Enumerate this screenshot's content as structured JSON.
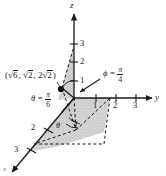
{
  "figure": {
    "axes": [
      {
        "name": "z",
        "id": "z-axis",
        "direction": "up"
      },
      {
        "name": "y",
        "id": "y-axis",
        "direction": "right"
      },
      {
        "name": "x",
        "id": "x-axis",
        "direction": "down-left"
      }
    ],
    "ticks": {
      "z": [
        "1",
        "2",
        "3"
      ],
      "y": [
        "1",
        "2",
        "3"
      ],
      "x": [
        "2",
        "3"
      ]
    },
    "point_label": {
      "full": "(√6, √2, 2√2)",
      "open_paren": "(",
      "x_radical": "6",
      "sep1": ", ",
      "y_radical": "2",
      "sep2": ", ",
      "z_coeff": "2",
      "z_radical": "2",
      "close_paren": ")"
    },
    "angles": [
      {
        "id": "theta-annotation",
        "symbol": "θ",
        "equals": "=",
        "numerator": "π",
        "denominator": "6",
        "text": "θ = π/6"
      },
      {
        "id": "phi-annotation",
        "symbol": "ϕ",
        "equals": "=",
        "numerator": "π",
        "denominator": "4",
        "text": "ϕ = π/4"
      }
    ],
    "arc_labels": [
      {
        "id": "theta-arc-label",
        "symbol": "θ"
      }
    ],
    "colors": {
      "ink": "#1a1a1a",
      "shade": "#c9c9c9",
      "shade_light": "#d8d8d8",
      "background": "#ffffff"
    },
    "credit": "©"
  }
}
